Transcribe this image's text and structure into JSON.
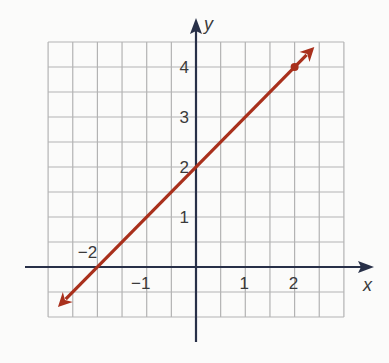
{
  "chart_data": {
    "type": "line",
    "title": "",
    "xlabel": "x",
    "ylabel": "y",
    "xlim": [
      -3,
      3
    ],
    "ylim": [
      -1,
      4.5
    ],
    "grid": true,
    "grid_step": 0.5,
    "x_ticks": [
      {
        "value": -2,
        "label": "−2"
      },
      {
        "value": -1,
        "label": "−1"
      },
      {
        "value": 1,
        "label": "1"
      },
      {
        "value": 2,
        "label": "2"
      }
    ],
    "y_ticks": [
      {
        "value": 1,
        "label": "1"
      },
      {
        "value": 2,
        "label": "2"
      },
      {
        "value": 3,
        "label": "3"
      },
      {
        "value": 4,
        "label": "4"
      }
    ],
    "series": [
      {
        "name": "line",
        "equation": "y = x + 2",
        "slope": 1,
        "intercept": 2,
        "x": [
          -2.8,
          2.4
        ],
        "y": [
          -0.8,
          4.4
        ],
        "arrows": "both",
        "color": "#a9301c",
        "marked_points": [
          {
            "x": 2,
            "y": 4
          }
        ]
      }
    ],
    "legend": "none"
  }
}
